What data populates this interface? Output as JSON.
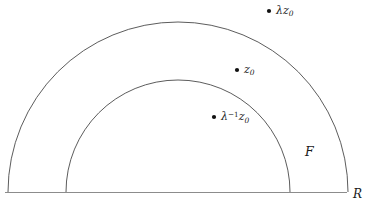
{
  "figure": {
    "background_color": "#ffffff",
    "stroke_color": "#4a4a4a",
    "axis_color": "#8c8c8c",
    "text_color": "#1a1a1a"
  },
  "axis": {
    "name": "real-axis",
    "label": "R",
    "label_full": "R",
    "y": 192,
    "x_start": 5,
    "x_end": 347
  },
  "arcs": [
    {
      "name": "outer-arc",
      "role": "outer boundary geodesic",
      "center_x": 178,
      "center_y": 192,
      "radius": 170,
      "left_endpoint_x": 8,
      "right_endpoint_x": 348,
      "apex_y": 22
    },
    {
      "name": "inner-arc",
      "role": "inner boundary geodesic",
      "center_x": 178,
      "center_y": 192,
      "radius": 112,
      "left_endpoint_x": 66,
      "right_endpoint_x": 290,
      "apex_y": 80
    }
  ],
  "points": [
    {
      "name": "point-lambda-z0",
      "bullet": "•",
      "label_prefix": "λ",
      "label_base": "z",
      "label_sub": "0",
      "label_sup": "",
      "label_plain": "λz₀",
      "dot_x": 269,
      "dot_y": 11,
      "text_x": 276,
      "text_y": 5
    },
    {
      "name": "point-z0",
      "bullet": "•",
      "label_prefix": "",
      "label_base": "z",
      "label_sub": "0",
      "label_sup": "",
      "label_plain": "z₀",
      "dot_x": 237,
      "dot_y": 70,
      "text_x": 244,
      "text_y": 64
    },
    {
      "name": "point-lambda-inverse-z0",
      "bullet": "•",
      "label_prefix": "λ",
      "label_base": "z",
      "label_sub": "0",
      "label_sup": "−1",
      "label_plain": "λ⁻¹z₀",
      "dot_x": 214,
      "dot_y": 117,
      "text_x": 221,
      "text_y": 111
    }
  ],
  "region": {
    "name": "fundamental-domain",
    "label": "F",
    "label_x": 305,
    "label_y": 152
  }
}
